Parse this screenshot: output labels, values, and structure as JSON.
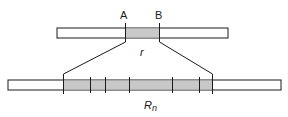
{
  "diagram": {
    "top_bar": {
      "label_a": "A",
      "label_b": "B",
      "region_label": "r"
    },
    "bottom_bar": {
      "label_main": "R",
      "label_sub": "n"
    },
    "colors": {
      "stroke": "#1a1a1a",
      "fill_plain": "#ffffff",
      "fill_shaded": "#c8c8c8"
    }
  }
}
